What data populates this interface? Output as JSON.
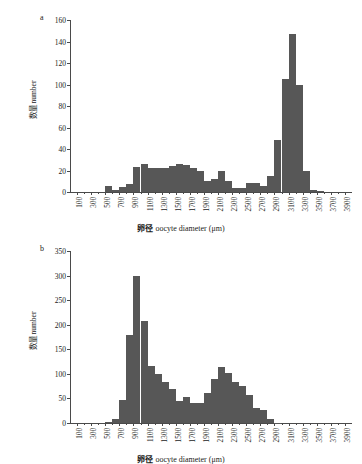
{
  "figure": {
    "background": "#ffffff",
    "bar_color": "#575757",
    "axis_color": "#4a4a4a"
  },
  "axis_titles": {
    "x_cn": "卵径",
    "x_en": "oocyte diameter (μm)",
    "y_cn": "数量",
    "y_en": "number"
  },
  "panels": [
    {
      "label": "a",
      "chart_data": {
        "type": "bar",
        "title": "",
        "xlabel": "卵径 oocyte diameter (μm)",
        "ylabel": "数量 number",
        "xlim": [
          0,
          4000
        ],
        "ylim": [
          0,
          160
        ],
        "ytick_values": [
          0,
          20,
          40,
          60,
          80,
          100,
          120,
          140,
          160
        ],
        "ytick_labels": [
          "0",
          "20",
          "40",
          "60",
          "80",
          "100",
          "120",
          "140",
          "160"
        ],
        "xtick_values": [
          100,
          300,
          500,
          700,
          900,
          1100,
          1300,
          1500,
          1700,
          1900,
          2100,
          2300,
          2500,
          2700,
          2900,
          3100,
          3300,
          3500,
          3700,
          3900
        ],
        "xtick_labels": [
          "100",
          "300",
          "500",
          "700",
          "900",
          "1100",
          "1300",
          "1500",
          "1700",
          "1900",
          "2100",
          "2300",
          "2500",
          "2700",
          "2900",
          "3100",
          "3300",
          "3500",
          "3700",
          "3900"
        ],
        "bin_width": 100,
        "bin_starts": [
          500,
          600,
          700,
          800,
          900,
          1000,
          1100,
          1200,
          1300,
          1400,
          1500,
          1600,
          1700,
          1800,
          1900,
          2000,
          2100,
          2200,
          2300,
          2400,
          2500,
          2600,
          2700,
          2800,
          2900,
          3000,
          3100,
          3200,
          3300,
          3400,
          3500,
          3600
        ],
        "values": [
          6,
          2,
          5,
          7,
          23,
          26,
          22,
          22,
          22,
          24,
          26,
          25,
          22,
          20,
          10,
          12,
          20,
          10,
          4,
          4,
          8,
          8,
          6,
          15,
          48,
          105,
          147,
          100,
          20,
          2,
          1,
          0
        ],
        "grid": false,
        "legend": "none"
      }
    },
    {
      "label": "b",
      "chart_data": {
        "type": "bar",
        "title": "",
        "xlabel": "卵径 oocyte diameter (μm)",
        "ylabel": "数量 number",
        "xlim": [
          0,
          4000
        ],
        "ylim": [
          0,
          350
        ],
        "ytick_values": [
          0,
          50,
          100,
          150,
          200,
          250,
          300,
          350
        ],
        "ytick_labels": [
          "0",
          "50",
          "100",
          "150",
          "200",
          "250",
          "300",
          "350"
        ],
        "xtick_values": [
          100,
          300,
          500,
          700,
          900,
          1100,
          1300,
          1500,
          1700,
          1900,
          2100,
          2300,
          2500,
          2700,
          2900,
          3100,
          3300,
          3500,
          3700,
          3900
        ],
        "xtick_labels": [
          "100",
          "300",
          "500",
          "700",
          "900",
          "1100",
          "1300",
          "1500",
          "1700",
          "1900",
          "2100",
          "2300",
          "2500",
          "2700",
          "2900",
          "3100",
          "3300",
          "3500",
          "3700",
          "3900"
        ],
        "bin_width": 100,
        "bin_starts": [
          500,
          600,
          700,
          800,
          900,
          1000,
          1100,
          1200,
          1300,
          1400,
          1500,
          1600,
          1700,
          1800,
          1900,
          2000,
          2100,
          2200,
          2300,
          2400,
          2500,
          2600,
          2700,
          2800,
          2900
        ],
        "values": [
          3,
          8,
          47,
          180,
          299,
          207,
          117,
          100,
          84,
          69,
          45,
          53,
          40,
          41,
          62,
          90,
          115,
          102,
          83,
          76,
          57,
          30,
          26,
          8,
          1
        ],
        "grid": false,
        "legend": "none"
      }
    }
  ]
}
